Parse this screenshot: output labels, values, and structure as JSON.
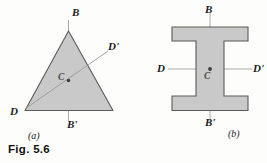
{
  "figure": {
    "caption": "Fig. 5.6",
    "background_color": "#fdfdfb",
    "shape_fill_color": "#c9c9c9",
    "shape_stroke_color": "#555555",
    "axis_line_color": "#9a9a9a",
    "text_color": "#1b1b1b"
  },
  "panel_a": {
    "part_label": "(a)",
    "shape": "triangle",
    "labels": {
      "axis_b_top": "B",
      "axis_b_bottom": "B'",
      "axis_d_left": "D",
      "axis_d_right": "D'",
      "centroid": "C"
    }
  },
  "panel_b": {
    "part_label": "(b)",
    "shape": "i-beam-cross-section",
    "labels": {
      "axis_b_top": "B",
      "axis_b_bottom": "B'",
      "axis_d_left": "D",
      "axis_d_right": "D'",
      "centroid": "C"
    }
  }
}
